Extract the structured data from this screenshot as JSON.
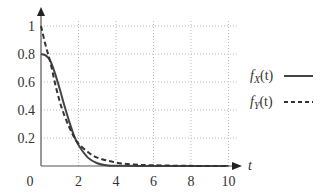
{
  "chart_data": {
    "type": "line",
    "title": "",
    "xlabel": "t",
    "ylabel": "",
    "xlim": [
      0,
      10.5
    ],
    "ylim": [
      0,
      1.05
    ],
    "grid": true,
    "legend_position": "right",
    "x_ticks": [
      "0",
      "2",
      "4",
      "6",
      "8",
      "10"
    ],
    "y_ticks": [
      "0.2",
      "0.4",
      "0.6",
      "0.8",
      "1"
    ],
    "series": [
      {
        "name": "f_X(t)",
        "style": "solid",
        "x": [
          0,
          0.25,
          0.5,
          0.75,
          1.0,
          1.25,
          1.5,
          1.75,
          2.0,
          2.5,
          3.0,
          3.5,
          4,
          6,
          8,
          10
        ],
        "values": [
          0.8,
          0.79,
          0.75,
          0.66,
          0.55,
          0.43,
          0.32,
          0.22,
          0.15,
          0.06,
          0.02,
          0.005,
          0.001,
          0,
          0,
          0
        ]
      },
      {
        "name": "f_Y(t)",
        "style": "dashed",
        "x": [
          0,
          0.25,
          0.5,
          0.75,
          1.0,
          1.25,
          1.5,
          1.75,
          2.0,
          2.5,
          3.0,
          4,
          5,
          6,
          8,
          10
        ],
        "values": [
          1.0,
          0.86,
          0.74,
          0.59,
          0.46,
          0.36,
          0.28,
          0.21,
          0.16,
          0.1,
          0.06,
          0.025,
          0.01,
          0.005,
          0.001,
          0
        ]
      }
    ]
  },
  "labels": {
    "origin": "0",
    "x_axis": "t",
    "legend_x": "f",
    "legend_x_sub": "X",
    "legend_x_arg": "(t)",
    "legend_y": "f",
    "legend_y_sub": "Y",
    "legend_y_arg": "(t)"
  }
}
